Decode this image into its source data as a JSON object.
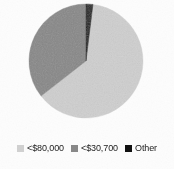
{
  "chart_data": {
    "type": "pie",
    "title": "",
    "categories": [
      "<$80,000",
      "<$30,700",
      "Other"
    ],
    "values": [
      62,
      36,
      2
    ],
    "unit": "percent",
    "colors": [
      "#d0d0d0",
      "#888888",
      "#111111"
    ],
    "legend_position": "bottom",
    "start_angle_deg": 0,
    "direction": "clockwise",
    "grid": false,
    "slices": [
      {
        "label": "<$80,000",
        "value": 62,
        "color": "#d0d0d0",
        "start_angle_deg": 7,
        "end_angle_deg": 232
      },
      {
        "label": "<$30,700",
        "value": 36,
        "color": "#888888",
        "start_angle_deg": 232,
        "end_angle_deg": 360
      },
      {
        "label": "Other",
        "value": 2,
        "color": "#111111",
        "start_angle_deg": 0,
        "end_angle_deg": 7
      }
    ]
  },
  "legend": {
    "items": [
      {
        "label": "<$80,000",
        "color": "#d0d0d0"
      },
      {
        "label": "<$30,700",
        "color": "#888888"
      },
      {
        "label": "Other",
        "color": "#111111"
      }
    ]
  },
  "geometry": {
    "center_x": 86,
    "center_y": 61,
    "radius": 57
  }
}
